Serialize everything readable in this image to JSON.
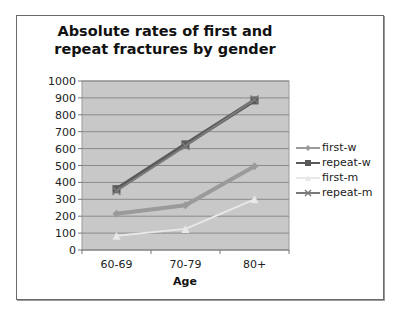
{
  "chart_data": {
    "type": "line",
    "title": "Absolute rates of first and repeat fractures by gender",
    "xlabel": "Age",
    "ylabel": "",
    "categories": [
      "60-69",
      "70-79",
      "80+"
    ],
    "ylim": [
      0,
      1000
    ],
    "yticks": [
      0,
      100,
      200,
      300,
      400,
      500,
      600,
      700,
      800,
      900,
      1000
    ],
    "grid": true,
    "legend_position": "right",
    "series": [
      {
        "name": "first-w",
        "values": [
          215,
          265,
          495
        ],
        "color": "#9a9a9a",
        "marker": "diamond",
        "width": 4
      },
      {
        "name": "repeat-w",
        "values": [
          360,
          625,
          885
        ],
        "color": "#5a5a5a",
        "marker": "square",
        "width": 4
      },
      {
        "name": "first-m",
        "values": [
          85,
          125,
          300
        ],
        "color": "#e8e8e8",
        "marker": "triangle",
        "width": 2
      },
      {
        "name": "repeat-m",
        "values": [
          350,
          615,
          890
        ],
        "color": "#7a7a7a",
        "marker": "x",
        "width": 2
      }
    ]
  },
  "title_line1": "Absolute rates of first and",
  "title_line2": "repeat fractures by gender",
  "legend": {
    "items": [
      "first-w",
      "repeat-w",
      "first-m",
      "repeat-m"
    ]
  }
}
